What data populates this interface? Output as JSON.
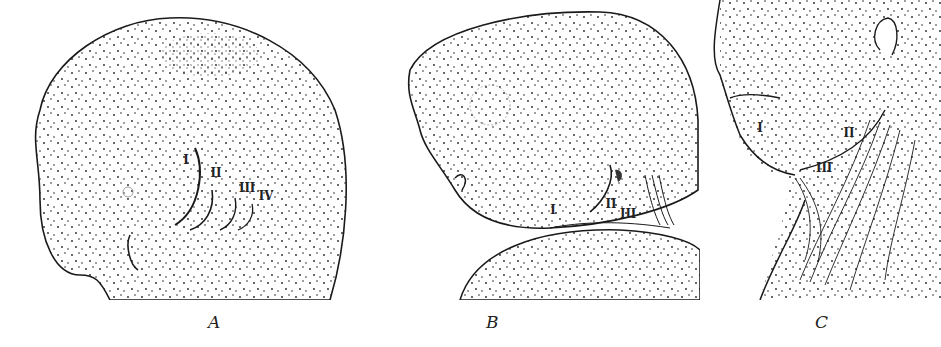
{
  "figure": {
    "panels": [
      {
        "id": "A",
        "caption": "A",
        "labels": [
          "I",
          "II",
          "III",
          "IV"
        ]
      },
      {
        "id": "B",
        "caption": "B",
        "labels": [
          "I",
          "II",
          "III"
        ]
      },
      {
        "id": "C",
        "caption": "C",
        "labels": [
          "I",
          "II",
          "III"
        ]
      }
    ],
    "colors": {
      "ink": "#1a1a1a",
      "paper": "#ffffff"
    }
  }
}
